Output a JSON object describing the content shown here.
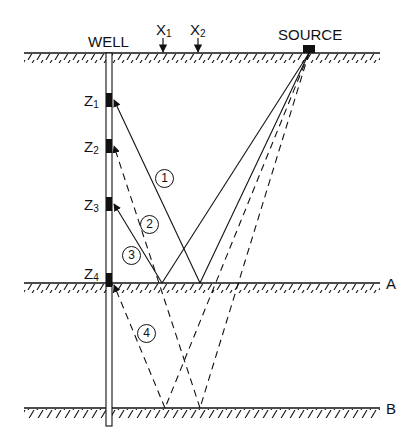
{
  "diagram": {
    "type": "seismic-ray-diagram",
    "labels": {
      "well": "WELL",
      "source": "SOURCE",
      "x1": "X",
      "x1_sub": "1",
      "x2": "X",
      "x2_sub": "2",
      "reflector_a": "A",
      "reflector_b": "B"
    },
    "receivers": [
      {
        "label": "Z",
        "sub": "1"
      },
      {
        "label": "Z",
        "sub": "2"
      },
      {
        "label": "Z",
        "sub": "3"
      },
      {
        "label": "Z",
        "sub": "4"
      }
    ],
    "rays": [
      {
        "id": "1",
        "style": "solid",
        "path": "source → A → Z1"
      },
      {
        "id": "2",
        "style": "dashed",
        "path": "source → B → A-crossing → Z2"
      },
      {
        "id": "3",
        "style": "solid",
        "path": "source → A → Z3"
      },
      {
        "id": "4",
        "style": "dashed",
        "path": "source → B → Z4"
      }
    ],
    "colors": {
      "ink": "#111111",
      "background": "#ffffff"
    }
  }
}
